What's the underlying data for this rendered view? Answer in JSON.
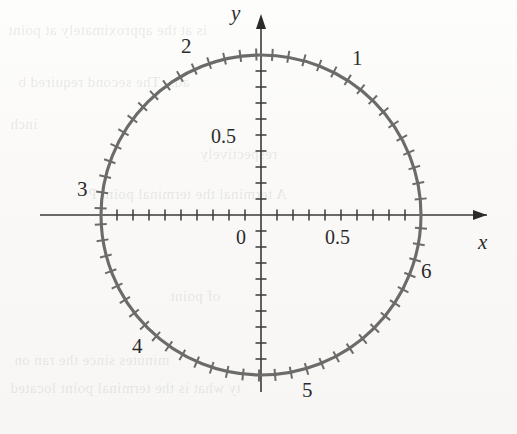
{
  "figure": {
    "background_color": "#fbfbf9",
    "curve_color": "#6b6b6b",
    "axis_color": "#3a3a3a",
    "text_color": "#2b2b2b"
  },
  "axes": {
    "x_label": "x",
    "y_label": "y",
    "origin_label": "0",
    "x_tick_label": "0.5",
    "y_tick_label": "0.5",
    "x_range": [
      -1.38,
      1.44
    ],
    "y_range": [
      -1.37,
      1.37
    ],
    "tick_spacing": 0.1
  },
  "radian_labels": [
    {
      "text": "1",
      "radians": 1
    },
    {
      "text": "2",
      "radians": 2
    },
    {
      "text": "3",
      "radians": 3
    },
    {
      "text": "4",
      "radians": 4
    },
    {
      "text": "5",
      "radians": 5
    },
    {
      "text": "6",
      "radians": 6
    }
  ],
  "ghost_text": [
    {
      "text": "is at the approximately at point"
    },
    {
      "text": "ads. The second required b"
    },
    {
      "text": "inch"
    },
    {
      "text": "respectively"
    },
    {
      "text": "A terminal the terminal point P"
    },
    {
      "text": "of point"
    },
    {
      "text": "minutes since the ran on"
    },
    {
      "text": "ty what is the terminal point located"
    }
  ],
  "chart_data": {
    "type": "line",
    "xlabel": "x",
    "ylabel": "y",
    "xlim": [
      -1.38,
      1.44
    ],
    "ylim": [
      -1.37,
      1.37
    ],
    "grid": false,
    "legend": null,
    "series": [
      {
        "name": "unit circle",
        "shape": "circle",
        "center": [
          0,
          0
        ],
        "radius": 1,
        "color": "#6b6b6b"
      }
    ],
    "annotations": [
      {
        "label": "1",
        "x": 0.5403,
        "y": 0.8415,
        "meaning": "t = 1 radian"
      },
      {
        "label": "2",
        "x": -0.4161,
        "y": 0.9093,
        "meaning": "t = 2 radians"
      },
      {
        "label": "3",
        "x": -0.99,
        "y": 0.1411,
        "meaning": "t = 3 radians"
      },
      {
        "label": "4",
        "x": -0.6536,
        "y": -0.7568,
        "meaning": "t = 4 radians"
      },
      {
        "label": "5",
        "x": 0.2837,
        "y": -0.9589,
        "meaning": "t = 5 radians"
      },
      {
        "label": "6",
        "x": 0.9602,
        "y": -0.2794,
        "meaning": "t = 6 radians"
      }
    ],
    "tick_marks": {
      "on_circle": "every 0.1 radian of arc length",
      "on_axes": "every 0.1 unit",
      "axis_labeled_values": [
        0,
        0.5
      ]
    }
  }
}
